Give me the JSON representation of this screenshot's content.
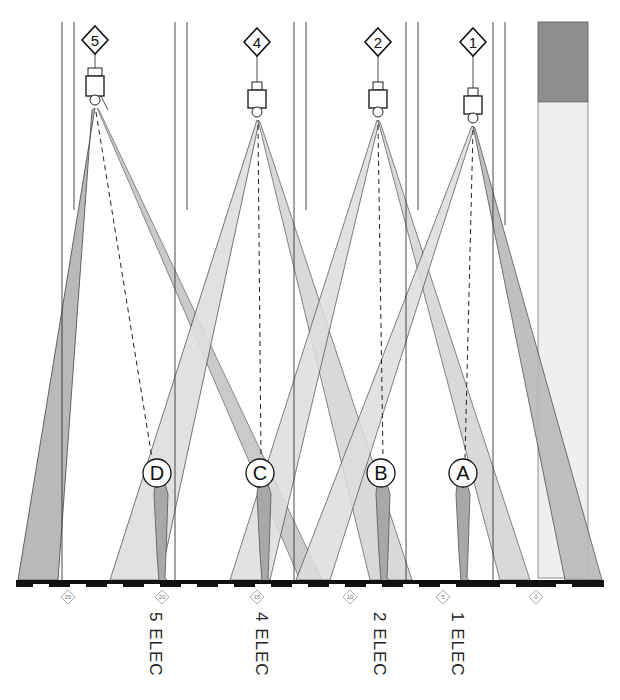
{
  "diagram": {
    "type": "stage lighting section",
    "fixtures": [
      {
        "id": "5",
        "x": 95
      },
      {
        "id": "4",
        "x": 257
      },
      {
        "id": "2",
        "x": 378
      },
      {
        "id": "1",
        "x": 473
      }
    ],
    "targets": [
      {
        "id": "D",
        "x": 155
      },
      {
        "id": "C",
        "x": 261
      },
      {
        "id": "B",
        "x": 380
      },
      {
        "id": "A",
        "x": 464
      }
    ],
    "scale_markers": [
      {
        "label": "25",
        "x": 68
      },
      {
        "label": "20",
        "x": 162
      },
      {
        "label": "15",
        "x": 257
      },
      {
        "label": "10",
        "x": 350
      },
      {
        "label": "5",
        "x": 443
      },
      {
        "label": "0",
        "x": 536
      }
    ],
    "electrics": [
      {
        "label": "5 ELEC",
        "x": 145
      },
      {
        "label": "4 ELEC",
        "x": 251
      },
      {
        "label": "2 ELEC",
        "x": 369
      },
      {
        "label": "1 ELEC",
        "x": 447
      }
    ],
    "colors": {
      "beam_dark": "#b9b9b9",
      "beam_light": "#dedede",
      "figure": "#a8a8a8",
      "panel_dark": "#8e8e8e",
      "panel_light": "#efefef",
      "line": "#222222"
    }
  }
}
